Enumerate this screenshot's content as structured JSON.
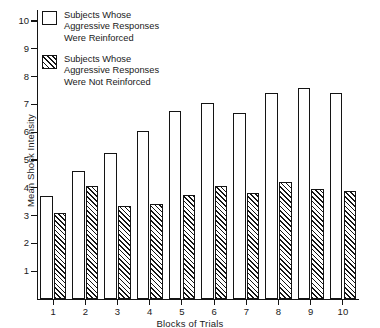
{
  "chart_data": {
    "type": "bar",
    "title": "",
    "xlabel": "Blocks of Trials",
    "ylabel": "Mean Shock Intensity",
    "categories": [
      "1",
      "2",
      "3",
      "4",
      "5",
      "6",
      "7",
      "8",
      "9",
      "10"
    ],
    "series": [
      {
        "name": "Subjects Whose\nAggressive Responses\nWere Reinforced",
        "fill": "white",
        "values": [
          3.7,
          4.6,
          5.25,
          6.05,
          6.75,
          7.05,
          6.7,
          7.4,
          7.6,
          7.4
        ]
      },
      {
        "name": "Subjects Whose\nAggressive Responses\nWere Not Reinforced",
        "fill": "hatched",
        "values": [
          3.1,
          4.05,
          3.35,
          3.4,
          3.75,
          4.05,
          3.8,
          4.2,
          3.95,
          3.9
        ]
      }
    ],
    "ylim": [
      0,
      10.5
    ],
    "yticks": [
      1,
      2,
      3,
      4,
      5,
      6,
      7,
      8,
      9,
      10
    ],
    "ytick_labels": [
      "1",
      "2",
      "3",
      "4",
      "5",
      "6",
      "7",
      "8",
      "9",
      "10"
    ],
    "grid": false,
    "legend_position": "top-left",
    "colors": {
      "axis": "#141414",
      "bar_outline": "#141414",
      "bar_fill": "#ffffff",
      "text": "#1a1a1a"
    }
  },
  "legend": {
    "entries": [
      {
        "label": "Subjects Whose\nAggressive Responses\nWere Reinforced"
      },
      {
        "label": "Subjects Whose\nAggressive Responses\nWere Not Reinforced"
      }
    ]
  },
  "axes": {
    "y_title": "Mean Shock Intensity",
    "x_title": "Blocks of Trials"
  }
}
